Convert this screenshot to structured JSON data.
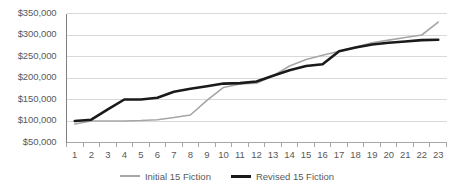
{
  "chart_data": {
    "type": "line",
    "title": "",
    "xlabel": "",
    "ylabel": "",
    "grid": true,
    "legend_position": "bottom",
    "ylim": [
      50000,
      350000
    ],
    "ytick_labels": [
      "$350,000",
      "$300,000",
      "$250,000",
      "$200,000",
      "$150,000",
      "$100,000",
      "$50,000"
    ],
    "ytick_values": [
      350000,
      300000,
      250000,
      200000,
      150000,
      100000,
      50000
    ],
    "categories": [
      "1",
      "2",
      "3",
      "4",
      "5",
      "6",
      "7",
      "8",
      "9",
      "10",
      "11",
      "12",
      "13",
      "14",
      "15",
      "16",
      "17",
      "18",
      "19",
      "20",
      "21",
      "22",
      "23"
    ],
    "x": [
      1,
      2,
      3,
      4,
      5,
      6,
      7,
      8,
      9,
      10,
      11,
      12,
      13,
      14,
      15,
      16,
      17,
      18,
      19,
      20,
      21,
      22,
      23
    ],
    "series": [
      {
        "name": "Initial  15 Fiction",
        "color": "#a6a6a6",
        "width": 1.6,
        "values": [
          93000,
          100000,
          100000,
          100000,
          101000,
          103000,
          108000,
          114000,
          148000,
          178000,
          186000,
          188000,
          205000,
          228000,
          243000,
          253000,
          262000,
          272000,
          282000,
          288000,
          294000,
          300000,
          330000
        ]
      },
      {
        "name": "Revised 15 Fiction",
        "color": "#1a1a1a",
        "width": 2.6,
        "values": [
          100000,
          103000,
          127000,
          150000,
          150000,
          154000,
          168000,
          175000,
          181000,
          187000,
          188000,
          192000,
          205000,
          218000,
          228000,
          232000,
          262000,
          271000,
          278000,
          282000,
          285000,
          288000,
          289000
        ]
      }
    ]
  },
  "legend": {
    "entries": [
      {
        "label": "Initial  15 Fiction"
      },
      {
        "label": "Revised 15 Fiction"
      }
    ]
  }
}
